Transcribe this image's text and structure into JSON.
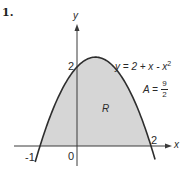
{
  "problem": {
    "number": "1."
  },
  "chart_data": {
    "type": "area",
    "title": "",
    "function": "y = 2 + x - x^2",
    "xlabel": "x",
    "ylabel": "y",
    "region_label": "R",
    "area_annotation": "A = 9/2",
    "area_value": 4.5,
    "x_intercepts": [
      -1,
      2
    ],
    "y_intercept": 2,
    "vertex": [
      0.5,
      2.25
    ],
    "shaded_region": {
      "from_x": -1,
      "to_x": 2,
      "between": "curve and x-axis"
    },
    "tick_labels": {
      "x": [
        "-1",
        "0",
        "2"
      ],
      "y": [
        "2"
      ]
    },
    "points": [
      [
        -1.1,
        -0.31
      ],
      [
        -1,
        0
      ],
      [
        -0.5,
        1.25
      ],
      [
        0,
        2
      ],
      [
        0.5,
        2.25
      ],
      [
        1,
        2
      ],
      [
        1.5,
        1.25
      ],
      [
        2,
        0
      ],
      [
        2.1,
        -0.31
      ]
    ],
    "grid": false,
    "colors": {
      "fill": "#d4d4d4",
      "curve": "#2e2e2e",
      "axes": "#3a3a3a"
    }
  },
  "labels": {
    "y_axis": "y",
    "x_axis": "x",
    "origin": "0",
    "x_neg1": "-1",
    "x_2": "2",
    "y_2": "2",
    "region": "R",
    "equation": "y = 2 + x - x",
    "equation_exp": "2",
    "area_lhs": "A =",
    "area_num": "9",
    "area_den": "2"
  }
}
